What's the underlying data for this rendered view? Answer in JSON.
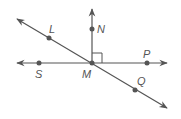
{
  "diagram": {
    "colors": {
      "line": "#555555",
      "point": "#555555",
      "label": "#555555",
      "background": "#ffffff"
    },
    "points": {
      "L": {
        "label": "L",
        "x": 49,
        "y": 38
      },
      "N": {
        "label": "N",
        "x": 92,
        "y": 29
      },
      "M": {
        "label": "M",
        "x": 92,
        "y": 63
      },
      "P": {
        "label": "P",
        "x": 147,
        "y": 63
      },
      "S": {
        "label": "S",
        "x": 39,
        "y": 63
      },
      "Q": {
        "label": "Q",
        "x": 135,
        "y": 90
      }
    },
    "lines": [
      {
        "name": "line-SP",
        "through": [
          "S",
          "M",
          "P"
        ],
        "arrows": "both"
      },
      {
        "name": "line-LQ",
        "through": [
          "L",
          "M",
          "Q"
        ],
        "arrows": "both"
      },
      {
        "name": "ray-MN",
        "through": [
          "M",
          "N"
        ],
        "arrows": "end"
      }
    ],
    "right_angle": {
      "vertex": "M",
      "between": [
        "N",
        "P"
      ]
    }
  }
}
